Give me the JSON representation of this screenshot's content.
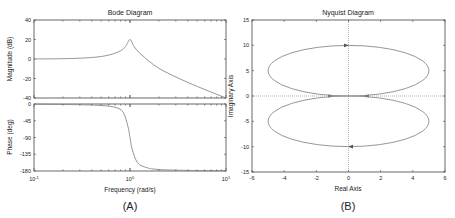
{
  "panels": {
    "a_label": "(A)",
    "b_label": "(B)"
  },
  "chart_data": [
    {
      "type": "line",
      "title": "Bode Diagram",
      "subplot": "magnitude",
      "xlabel": "Frequency  (rad/s)",
      "ylabel": "Magnitude (dB)",
      "xscale": "log",
      "xlim": [
        0.1,
        10
      ],
      "ylim": [
        -40,
        40
      ],
      "xticks": [
        "10^-1",
        "10^0",
        "10^1"
      ],
      "yticks": [
        40,
        20,
        0,
        -20,
        -40
      ],
      "x": [
        0.1,
        0.2,
        0.4,
        0.6,
        0.8,
        0.9,
        1.0,
        1.1,
        1.3,
        2,
        4,
        10
      ],
      "values": [
        0.1,
        0.3,
        1.5,
        4,
        8.5,
        13,
        20,
        13,
        5,
        -9.5,
        -24,
        -40
      ]
    },
    {
      "type": "line",
      "title": "",
      "subplot": "phase",
      "xlabel": "Frequency  (rad/s)",
      "ylabel": "Phase (deg)",
      "xscale": "log",
      "xlim": [
        0.1,
        10
      ],
      "ylim": [
        -180,
        0
      ],
      "xticks": [
        "10^-1",
        "10^0",
        "10^1"
      ],
      "yticks": [
        0,
        -45,
        -90,
        -135,
        -180
      ],
      "x": [
        0.1,
        0.3,
        0.5,
        0.7,
        0.85,
        0.95,
        1.0,
        1.05,
        1.2,
        1.5,
        2,
        4,
        10
      ],
      "values": [
        -0.6,
        -2,
        -4,
        -9,
        -22,
        -60,
        -90,
        -120,
        -158,
        -171,
        -176,
        -178.5,
        -179.5
      ]
    },
    {
      "type": "line",
      "title": "Nyquist Diagram",
      "xlabel": "Real Axis",
      "ylabel": "Imaginary Axis",
      "xlim": [
        -6,
        6
      ],
      "ylim": [
        -15,
        15
      ],
      "xticks": [
        -6,
        -4,
        -2,
        0,
        2,
        4,
        6
      ],
      "yticks": [
        15,
        10,
        5,
        0,
        -5,
        -10,
        -15
      ],
      "series": [
        {
          "name": "positive frequencies",
          "shape": "ellipse",
          "center": [
            0,
            5
          ],
          "semi_axes": [
            5,
            5
          ],
          "note": "clockwise, arrow at (0,10)"
        },
        {
          "name": "negative frequencies",
          "shape": "ellipse",
          "center": [
            0,
            -5
          ],
          "semi_axes": [
            5,
            5
          ],
          "note": "arrow at (0,-10)"
        }
      ],
      "grid": "zero lines dotted"
    }
  ]
}
